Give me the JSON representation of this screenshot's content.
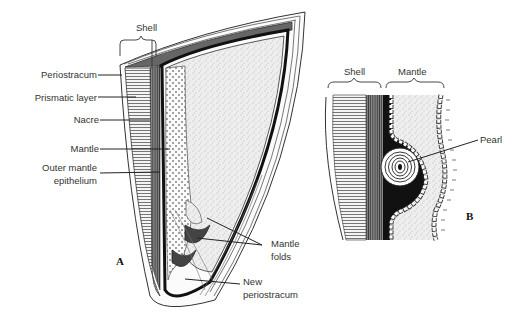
{
  "figure": {
    "panel_a": {
      "panel_label": "A",
      "brace_label": "Shell",
      "labels": {
        "periostracum": "Periostracum",
        "prismatic_layer": "Prismatic layer",
        "nacre": "Nacre",
        "mantle": "Mantle",
        "outer_mantle_epithelium_1": "Outer mantle",
        "outer_mantle_epithelium_2": "epithelium",
        "mantle_folds_1": "Mantle",
        "mantle_folds_2": "folds",
        "new_periostracum_1": "New",
        "new_periostracum_2": "periostracum"
      }
    },
    "panel_b": {
      "panel_label": "B",
      "brace_shell": "Shell",
      "brace_mantle": "Mantle",
      "labels": {
        "pearl": "Pearl"
      }
    }
  }
}
